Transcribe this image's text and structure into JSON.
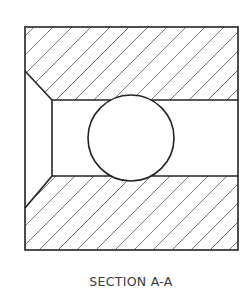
{
  "drawing": {
    "title": "SECTION A-A",
    "stroke_color": "#222222",
    "hatch_color": "#555555",
    "outer_box": {
      "x": 25,
      "y": 27,
      "width": 213,
      "height": 223
    },
    "inner_bore": {
      "x": 52,
      "y": 100,
      "width": 186,
      "height": 76
    },
    "chamfer_top": {
      "from": [
        25,
        71
      ],
      "to": [
        52,
        100
      ]
    },
    "chamfer_bottom": {
      "from": [
        52,
        176
      ],
      "to": [
        25,
        208
      ]
    },
    "ball": {
      "cx": 131,
      "cy": 138,
      "r": 43
    },
    "hatch": {
      "angle_deg": 45,
      "spacing": 19
    }
  }
}
